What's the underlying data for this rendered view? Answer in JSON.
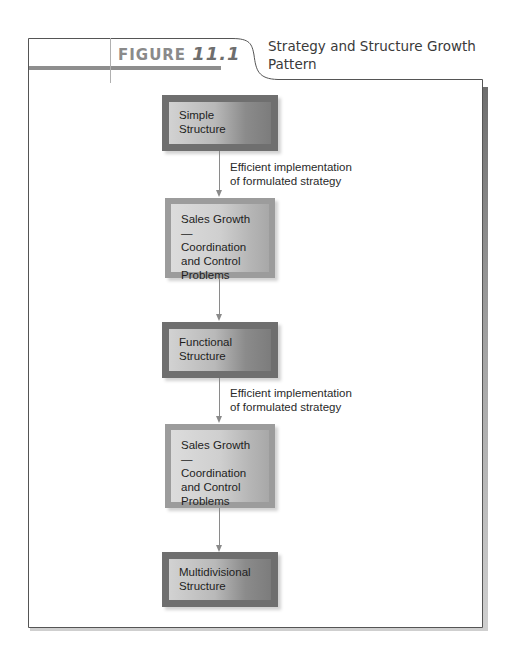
{
  "figure": {
    "label": "FIGURE",
    "number": "11.1",
    "title": "Strategy and Structure Growth Pattern"
  },
  "diagram": {
    "nodes": [
      {
        "id": "simple",
        "style": "dark",
        "lines": [
          "Simple",
          "Structure"
        ]
      },
      {
        "id": "sales1",
        "style": "light",
        "lines": [
          "Sales Growth—",
          "Coordination",
          "and Control",
          "Problems"
        ]
      },
      {
        "id": "functional",
        "style": "dark",
        "lines": [
          "Functional",
          "Structure"
        ]
      },
      {
        "id": "sales2",
        "style": "light",
        "lines": [
          "Sales Growth—",
          "Coordination",
          "and Control",
          "Problems"
        ]
      },
      {
        "id": "multidivisional",
        "style": "dark",
        "lines": [
          "Multidivisional",
          "Structure"
        ]
      }
    ],
    "edges": [
      {
        "from": "simple",
        "to": "sales1",
        "label": [
          "Efficient implementation",
          "of formulated strategy"
        ]
      },
      {
        "from": "sales1",
        "to": "functional",
        "label": []
      },
      {
        "from": "functional",
        "to": "sales2",
        "label": [
          "Efficient implementation",
          "of formulated strategy"
        ]
      },
      {
        "from": "sales2",
        "to": "multidivisional",
        "label": []
      }
    ]
  },
  "colors": {
    "frame_border": "#555555",
    "frame_shadow": "#7a7a7a",
    "tab_bar": "#8e8e8e",
    "dark_box_frame": "#6f6f6f",
    "light_box_frame": "#9c9c9c",
    "arrow": "#8a8a8a"
  }
}
